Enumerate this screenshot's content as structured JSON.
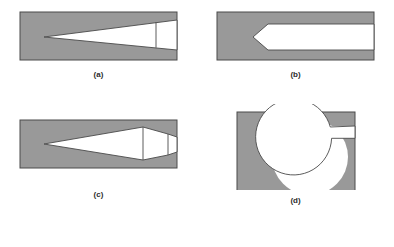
{
  "figure": {
    "background_color": "#ffffff",
    "fill_gray": "#999999",
    "fill_white": "#ffffff",
    "outline_color": "#4a4a4a",
    "label_color": "#2b2b2b",
    "panels": [
      {
        "id": "a",
        "label": "(a)",
        "shape_name": "sharp-wedge-cavity",
        "description": "Rectangular gray block containing a white sharp wedge opening that tapers from a point at the left to a wide mouth at the right edge, with a vertical internal line near the right.",
        "block": {
          "x": 20,
          "y": 4,
          "width": 157,
          "height": 48
        },
        "wedge_apex": {
          "x": 44,
          "y": 29
        },
        "wedge_mouth_top": {
          "x": 177,
          "y": 12
        },
        "wedge_mouth_bottom": {
          "x": 177,
          "y": 42
        },
        "divider_line_x": 156
      },
      {
        "id": "b",
        "label": "(b)",
        "shape_name": "blunt-chevron-cavity",
        "description": "Rectangular gray block containing a white elongated body whose left end forms a leftward-pointing chevron notch; the body runs flat to the right edge of the block.",
        "block": {
          "x": 20,
          "y": 4,
          "width": 157,
          "height": 48
        },
        "chevron_tip": {
          "x": 56,
          "y": 29
        },
        "body_top_y": 16,
        "body_bottom_y": 42,
        "body_right_x": 177,
        "shoulder_x": 71
      },
      {
        "id": "c",
        "label": "(c)",
        "shape_name": "double-wedge-cavity",
        "description": "Rectangular gray block containing a white double-wedge (lens) that points at the left, reaches maximum thickness near the right, then tapers to a short flat tail, with two vertical internal lines.",
        "block": {
          "x": 20,
          "y": 12,
          "width": 157,
          "height": 48
        },
        "wedge_apex": {
          "x": 44,
          "y": 36
        },
        "max_thickness_x": 143,
        "max_top_y": 19,
        "max_bottom_y": 52,
        "tail_end_x": 177,
        "tail_top_y": 29,
        "tail_bottom_y": 44,
        "divider_line_x": [
          143,
          168
        ]
      },
      {
        "id": "d",
        "label": "(d)",
        "shape_name": "circular-cavity-with-tab",
        "description": "Gray rectangular block containing a large white circle with a narrow rectangular white tab extending from the upper right of the circle out to the right edge of the block.",
        "block": {
          "x": 40,
          "y": 8,
          "width": 118,
          "height": 91
        },
        "circle_center": {
          "x": 113,
          "y": 53
        },
        "circle_radius": 38,
        "tab": {
          "x_start": 130,
          "x_end": 158,
          "y_top": 22,
          "y_bottom": 34
        }
      }
    ]
  }
}
